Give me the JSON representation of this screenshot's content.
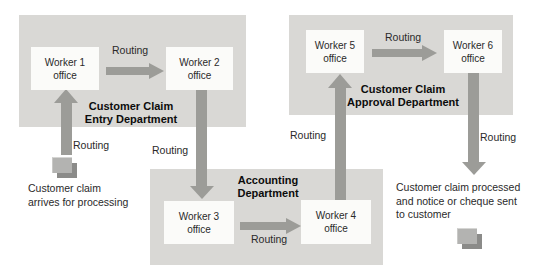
{
  "diagram_title": "Customer claim processing workflow",
  "labels": {
    "routing": "Routing"
  },
  "departments": {
    "entry": {
      "line1": "Customer Claim",
      "line2": "Entry Department"
    },
    "approval": {
      "line1": "Customer Claim",
      "line2": "Approval Department"
    },
    "accounting": {
      "line1": "Accounting",
      "line2": "Department"
    }
  },
  "workers": [
    {
      "line1": "Worker 1",
      "line2": "office"
    },
    {
      "line1": "Worker 2",
      "line2": "office"
    },
    {
      "line1": "Worker 3",
      "line2": "office"
    },
    {
      "line1": "Worker 4",
      "line2": "office"
    },
    {
      "line1": "Worker 5",
      "line2": "office"
    },
    {
      "line1": "Worker 6",
      "line2": "office"
    }
  ],
  "captions": {
    "input": {
      "line1": "Customer claim",
      "line2": "arrives for processing"
    },
    "output": {
      "line1": "Customer claim processed",
      "line2": "and notice or cheque sent",
      "line3": "to customer"
    }
  },
  "icons": {
    "input_document": "document-stack-icon",
    "output_document": "document-stack-icon"
  },
  "colors": {
    "dept_fill": "#d9d8d5",
    "node_fill": "#fbfbf9",
    "arrow": "#9c9c98",
    "text": "#2a2a2a",
    "bold_text": "#0c0c0c",
    "icon_light": "#b3b3b1",
    "icon_dark": "#8b8b89",
    "background": "#ffffff"
  }
}
